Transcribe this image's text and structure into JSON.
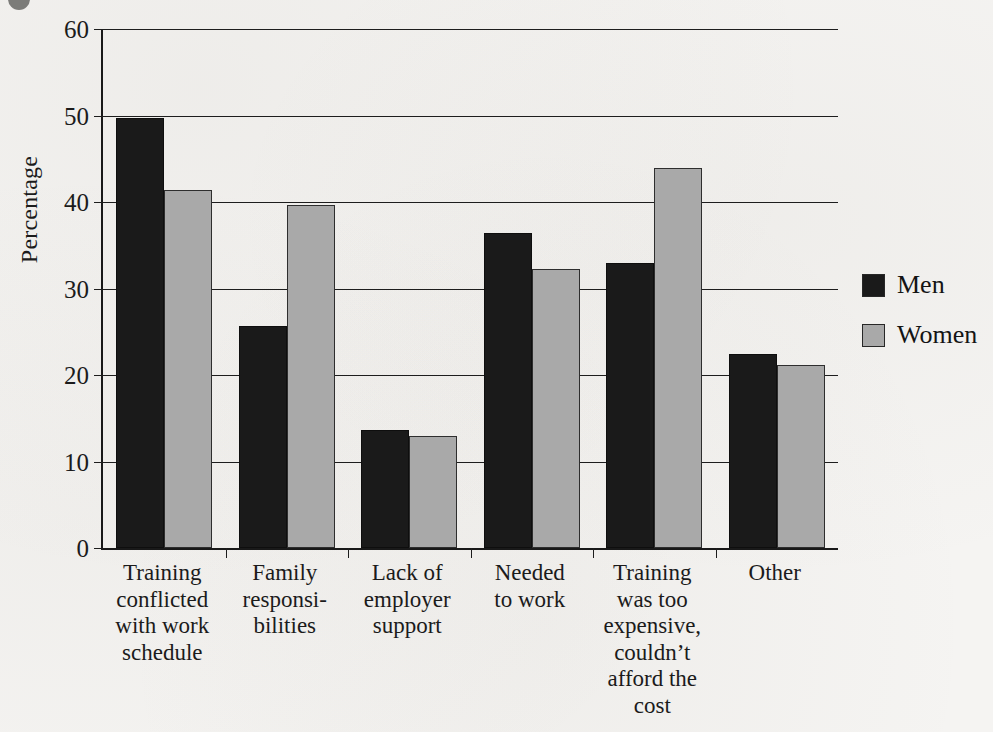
{
  "chart_data": {
    "type": "bar",
    "title": "",
    "xlabel": "",
    "ylabel": "Percentage",
    "ylim": [
      0,
      60
    ],
    "yticks": [
      0,
      10,
      20,
      30,
      40,
      50,
      60
    ],
    "ytick_labels": [
      "0",
      "10",
      "20",
      "30",
      "40",
      "50",
      "60"
    ],
    "grid": "horizontal",
    "legend_position": "right",
    "categories": [
      "Training conflicted with work schedule",
      "Family responsi- bilities",
      "Lack of employer support",
      "Needed to work",
      "Training was too expensive, couldn't afford the cost",
      "Other"
    ],
    "category_lines": [
      [
        "Training",
        "conflicted",
        "with work",
        "schedule"
      ],
      [
        "Family",
        "responsi-",
        "bilities"
      ],
      [
        "Lack of",
        "employer",
        "support"
      ],
      [
        "Needed",
        "to work"
      ],
      [
        "Training",
        "was too",
        "expensive,",
        "couldn't",
        "afford the",
        "cost"
      ],
      [
        "Other"
      ]
    ],
    "series": [
      {
        "name": "Men",
        "color": "#1a1a1a",
        "values": [
          49.7,
          25.7,
          13.6,
          36.4,
          32.9,
          22.4
        ]
      },
      {
        "name": "Women",
        "color": "#a9a9a9",
        "values": [
          41.4,
          39.6,
          12.9,
          32.2,
          43.9,
          21.2
        ]
      }
    ]
  },
  "legend": {
    "items": [
      {
        "label": "Men",
        "swatch": "men"
      },
      {
        "label": "Women",
        "swatch": "women"
      }
    ]
  }
}
